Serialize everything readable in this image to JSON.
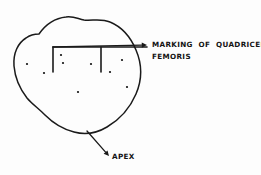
{
  "diagram": {
    "background_color": "#fdfdfd",
    "ink_color": "#1a1a1a",
    "labels": {
      "marking_line1": "MARKING  OF  QUADRICEPS",
      "marking_line2": "FEMORIS",
      "apex": "APEX"
    },
    "annotations": [
      {
        "name": "quadriceps-marking",
        "text": "MARKING  OF  QUADRICEPS FEMORIS",
        "leader_from": [
          53,
          47
        ],
        "leader_to": [
          147,
          45
        ],
        "arrow_direction": "right"
      },
      {
        "name": "apex",
        "text": "APEX",
        "leader_from": [
          87,
          131
        ],
        "leader_to": [
          109,
          156
        ],
        "arrow_direction": "down-right"
      }
    ],
    "bracket": {
      "name": "quadriceps-bracket",
      "horizontal_y": 47,
      "x_start": 53,
      "x_end": 147,
      "tick_bottom_y": 72,
      "tick_x_positions": [
        53,
        101
      ]
    },
    "stipple_dots": [
      {
        "cx": 27,
        "cy": 64,
        "r": 1.1
      },
      {
        "cx": 44,
        "cy": 73,
        "r": 1.1
      },
      {
        "cx": 61,
        "cy": 55,
        "r": 1.1
      },
      {
        "cx": 63,
        "cy": 63,
        "r": 1.1
      },
      {
        "cx": 91,
        "cy": 64,
        "r": 1.1
      },
      {
        "cx": 110,
        "cy": 72,
        "r": 1.1
      },
      {
        "cx": 122,
        "cy": 60,
        "r": 1.1
      },
      {
        "cx": 127,
        "cy": 87,
        "r": 1.1
      },
      {
        "cx": 78,
        "cy": 92,
        "r": 1.1
      }
    ],
    "outline_path": "M 39,34 C 46,24 56,18 66,17 C 74,16 78,19 84,20 C 92,21 101,18 110,22 C 122,27 131,38 136,50 C 142,64 142,80 136,94 C 130,108 119,120 107,127 C 97,133 85,135 74,132 C 62,129 52,122 45,115 C 38,108 32,104 27,98 C 20,89 15,78 14,66 C 13,53 18,43 26,38 C 30,35 35,34 39,34 Z"
  }
}
